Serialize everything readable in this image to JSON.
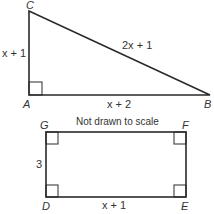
{
  "triangle": {
    "vertices": {
      "A": {
        "label": "A",
        "x": 29,
        "y": 95
      },
      "B": {
        "label": "B",
        "x": 210,
        "y": 95
      },
      "C": {
        "label": "C",
        "x": 29,
        "y": 11
      }
    },
    "sides": {
      "AC": "x + 1",
      "CB": "2x + 1",
      "AB": "x + 2"
    },
    "right_angle_at": "A"
  },
  "note": "Not drawn to scale",
  "rectangle": {
    "vertices": {
      "G": {
        "label": "G"
      },
      "F": {
        "label": "F"
      },
      "D": {
        "label": "D"
      },
      "E": {
        "label": "E"
      }
    },
    "sides": {
      "GD": "3",
      "DE": "x + 1"
    }
  },
  "colors": {
    "stroke": "#2a2a2a",
    "text": "#333333",
    "background": "#ffffff"
  }
}
